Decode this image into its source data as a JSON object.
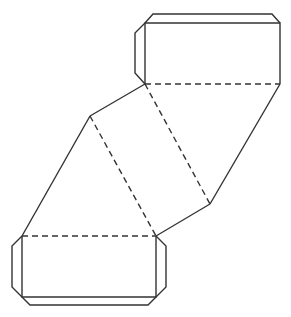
{
  "diagram": {
    "title": "",
    "colors": {
      "line": "#333333",
      "background": "#ffffff"
    },
    "line_styles": {
      "cut": "solid",
      "fold": "dashed"
    },
    "parts": [
      {
        "id": "top-rectangle",
        "kind": "face"
      },
      {
        "id": "top-tab-upper",
        "kind": "glue-tab"
      },
      {
        "id": "top-tab-left",
        "kind": "glue-tab"
      },
      {
        "id": "upper-parallelogram",
        "kind": "face"
      },
      {
        "id": "lower-parallelogram",
        "kind": "face"
      },
      {
        "id": "bottom-rectangle",
        "kind": "face"
      },
      {
        "id": "bottom-tab-left",
        "kind": "glue-tab"
      },
      {
        "id": "bottom-tab-right",
        "kind": "glue-tab"
      },
      {
        "id": "bottom-tab-lower",
        "kind": "glue-tab"
      }
    ]
  }
}
